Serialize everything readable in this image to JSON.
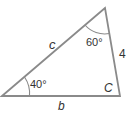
{
  "diagram": {
    "type": "triangle",
    "colors": {
      "stroke": "#8a8a8a",
      "text": "#333333",
      "background": "#ffffff"
    },
    "vertices": {
      "left": [
        2,
        96
      ],
      "top": [
        105,
        8
      ],
      "right": [
        120,
        96
      ]
    },
    "sides": {
      "c": {
        "label": "c",
        "between": [
          "left",
          "top"
        ]
      },
      "a": {
        "label": "4",
        "between": [
          "top",
          "right"
        ]
      },
      "b": {
        "label": "b",
        "between": [
          "left",
          "right"
        ]
      }
    },
    "angles": {
      "left": {
        "label": "40°"
      },
      "top": {
        "label": "60°"
      },
      "right": {
        "label": "C"
      }
    }
  }
}
